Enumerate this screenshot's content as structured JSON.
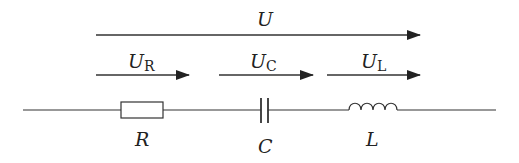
{
  "diagram": {
    "type": "series RLC circuit voltage diagram",
    "stroke_color": "#333333",
    "voltages": [
      {
        "id": "U",
        "symbol": "U",
        "subscript": "",
        "description": "total voltage"
      },
      {
        "id": "UR",
        "symbol": "U",
        "subscript": "R",
        "description": "voltage across resistor"
      },
      {
        "id": "UC",
        "symbol": "U",
        "subscript": "C",
        "description": "voltage across capacitor"
      },
      {
        "id": "UL",
        "symbol": "U",
        "subscript": "L",
        "description": "voltage across inductor"
      }
    ],
    "components": [
      {
        "id": "R",
        "label": "R",
        "kind": "resistor"
      },
      {
        "id": "C",
        "label": "C",
        "kind": "capacitor"
      },
      {
        "id": "L",
        "label": "L",
        "kind": "inductor"
      }
    ]
  }
}
